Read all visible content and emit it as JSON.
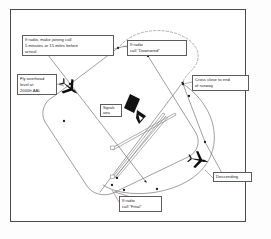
{
  "figure": {
    "background_color": "#ffffff",
    "frame_color": "#4a4a4a",
    "ink_color": "#1b1b1b"
  },
  "labels": {
    "joining_call": "If radio, make joining call\n5 minutes or 15 miles before\narrival",
    "downwind_call": "If radio\ncall \"Downwind\"",
    "fly_overhead": "Fly overhead\nlevel at\n2000ft AAL",
    "cross_end": "Cross close to end\nof runway",
    "signals_area": "Signals\narea",
    "descending": "Descending",
    "final_call": "If radio\ncall \"Final\""
  },
  "icons": {
    "aircraft_inbound": "aircraft-icon",
    "aircraft_descending": "aircraft-icon",
    "signal_square": "signal-square-icon",
    "windsock": "windsock-icon"
  },
  "diagram": {
    "circuit_pattern": "rounded rectangle circuit, tilted",
    "deadside_arc": "dashed descent arc",
    "descent_curve": "large teardrop descending track",
    "runways": "two crossing runway strips"
  }
}
